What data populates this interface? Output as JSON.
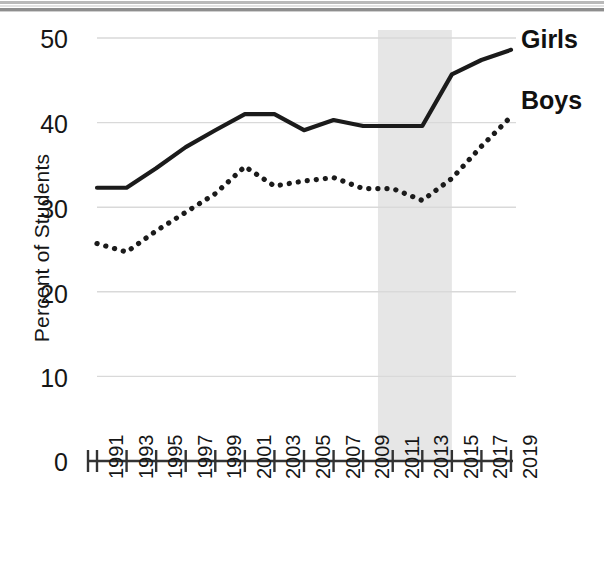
{
  "chart_data": {
    "type": "line",
    "title": "",
    "subtitle": "",
    "xlabel": "",
    "ylabel": "Percent of Students",
    "xlim": [
      1991,
      2019
    ],
    "ylim": [
      0,
      50
    ],
    "grid": true,
    "gridlines_y": [
      10,
      20,
      30,
      40,
      50
    ],
    "legend_position": "right-inline",
    "x": [
      1991,
      1993,
      1995,
      1997,
      1999,
      2001,
      2003,
      2005,
      2007,
      2009,
      2011,
      2013,
      2015,
      2017,
      2019
    ],
    "xtick_labels": [
      "1991",
      "1993",
      "1995",
      "1997",
      "1999",
      "2001",
      "2003",
      "2005",
      "2007",
      "2009",
      "2011",
      "2013",
      "2015",
      "2017",
      "2019"
    ],
    "ytick_labels": [
      "0",
      "10",
      "20",
      "30",
      "40",
      "50"
    ],
    "ytick_values": [
      0,
      10,
      20,
      30,
      40,
      50
    ],
    "series": [
      {
        "name": "Girls",
        "style": "solid",
        "color": "#1b1b1b",
        "values": [
          32.3,
          32.3,
          34.6,
          37.1,
          39.1,
          41.0,
          41.0,
          39.1,
          40.3,
          39.6,
          39.6,
          39.6,
          45.7,
          47.4,
          48.6
        ]
      },
      {
        "name": "Boys",
        "style": "dotted",
        "color": "#1b1b1b",
        "values": [
          25.7,
          24.7,
          27.2,
          29.4,
          31.6,
          34.8,
          32.5,
          33.1,
          33.5,
          32.2,
          32.2,
          30.8,
          33.4,
          37.2,
          40.7
        ]
      }
    ],
    "shaded_region": {
      "x_start": 2010,
      "x_end": 2015,
      "color": "#e6e6e6",
      "label": ""
    },
    "annotations": [
      {
        "name": "Girls",
        "text": "Girls",
        "x": 2019,
        "y": 49.4
      },
      {
        "name": "Boys",
        "text": "Boys",
        "x": 2019,
        "y": 41.8
      }
    ]
  },
  "axes": {
    "y_title": "Percent of Students",
    "y_labels": [
      "50",
      "40",
      "30",
      "20",
      "10",
      "0"
    ],
    "x_labels": [
      "1991",
      "1993",
      "1995",
      "1997",
      "1999",
      "2001",
      "2003",
      "2005",
      "2007",
      "2009",
      "2011",
      "2013",
      "2015",
      "2017",
      "2019"
    ]
  },
  "legend": {
    "girls_label": "Girls",
    "boys_label": "Boys"
  },
  "colors": {
    "line": "#1b1b1b",
    "grid": "#d9d9d9",
    "axis": "#333333",
    "shade": "#e6e6e6",
    "text": "#161616",
    "background": "#ffffff"
  }
}
